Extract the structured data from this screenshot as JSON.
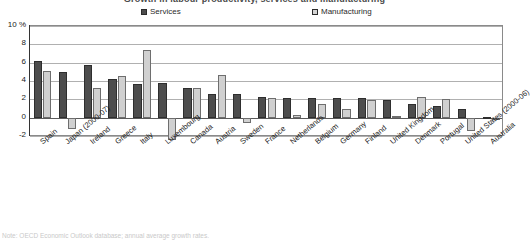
{
  "figure": {
    "title_clipped": "Growth in labour productivity, services and manufacturing",
    "footnote_clipped": "Note: OECD Economic Outlook database; annual average growth rates."
  },
  "legend": {
    "position": "top",
    "items": [
      {
        "label": "Services",
        "color": "#4d4d4d",
        "key": "services"
      },
      {
        "label": "Manufacturing",
        "color": "#d0d0d0",
        "key": "manufacturing"
      }
    ]
  },
  "axes": {
    "y_ticks": [
      "10 %",
      "8",
      "6",
      "4",
      "2",
      "0",
      "-2"
    ],
    "y_tick_values": [
      10,
      8,
      6,
      4,
      2,
      0,
      -2
    ],
    "ymin": -2.1,
    "ymax": 10,
    "grid": true
  },
  "chart_data": {
    "type": "bar",
    "title": "Growth in labour productivity, services and manufacturing",
    "xlabel": "",
    "ylabel": "%",
    "ylim": [
      -2.1,
      10
    ],
    "grid": true,
    "legend_position": "top",
    "categories": [
      "Spain",
      "Japan (2000-07)",
      "Ireland",
      "Greece",
      "Italy",
      "Luxembourg",
      "Canada",
      "Austria",
      "Sweden",
      "France",
      "Netherlands",
      "Belgium",
      "Germany",
      "Finland",
      "United Kingdom",
      "Denmark",
      "Portugal",
      "United States (2000-06)",
      "Australia"
    ],
    "series": [
      {
        "name": "Services",
        "color": "#4d4d4d",
        "values": [
          6.2,
          5.0,
          5.8,
          4.2,
          3.7,
          3.8,
          3.2,
          2.6,
          2.6,
          2.3,
          2.2,
          2.1,
          2.2,
          2.1,
          1.9,
          1.5,
          1.3,
          1.0,
          0.1
        ]
      },
      {
        "name": "Manufacturing",
        "color": "#d0d0d0",
        "values": [
          5.1,
          -1.2,
          3.2,
          4.6,
          7.4,
          -2.4,
          3.2,
          4.7,
          -0.6,
          2.2,
          0.3,
          1.5,
          0.9,
          1.9,
          0.2,
          2.3,
          2.0,
          -1.4,
          -0.1
        ]
      }
    ]
  }
}
